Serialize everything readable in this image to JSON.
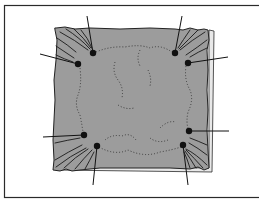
{
  "figure": {
    "colors": {
      "background": "#ffffff",
      "frame": "#2a2a2a",
      "fabric": "#9a9a9a",
      "fabric_edge": "#2a2a2a",
      "ink": "#111111",
      "dotted_line": "#3a3a3a"
    },
    "pins": [
      {
        "id": "top-left-upper",
        "x": 93,
        "y": 53,
        "leader_to": [
          87,
          16
        ]
      },
      {
        "id": "top-left-lower",
        "x": 78,
        "y": 64,
        "leader_to": [
          40,
          54
        ]
      },
      {
        "id": "top-right-upper",
        "x": 175,
        "y": 53,
        "leader_to": [
          182,
          16
        ]
      },
      {
        "id": "top-right-lower",
        "x": 188,
        "y": 63,
        "leader_to": [
          228,
          57
        ]
      },
      {
        "id": "bottom-left-upper",
        "x": 84,
        "y": 135,
        "leader_to": [
          43,
          137
        ]
      },
      {
        "id": "bottom-left-lower",
        "x": 97,
        "y": 146,
        "leader_to": [
          93,
          185
        ]
      },
      {
        "id": "bottom-right-upper",
        "x": 189,
        "y": 131,
        "leader_to": [
          229,
          131
        ]
      },
      {
        "id": "bottom-right-lower",
        "x": 183,
        "y": 145,
        "leader_to": [
          188,
          185
        ]
      }
    ]
  }
}
